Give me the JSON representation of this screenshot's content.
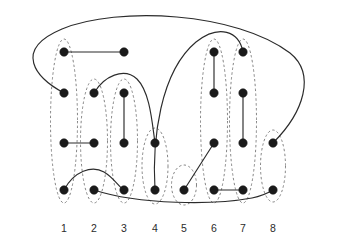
{
  "figure": {
    "canvas": {
      "width": 340,
      "height": 243
    },
    "colors": {
      "vertex": "#1a1a1a",
      "edge": "#2b2b2b",
      "ellipse": "#6f6f6f",
      "label": "#2b2b2b",
      "background": "#ffffff"
    },
    "style": {
      "vertex_radius": 4.2,
      "edge_width": 1.15,
      "ellipse_dash": "2.4 2.4"
    }
  },
  "columns": [
    {
      "label": "1",
      "x": 64,
      "label_x": 64,
      "label_y": 232
    },
    {
      "label": "2",
      "x": 94,
      "label_x": 94,
      "label_y": 232
    },
    {
      "label": "3",
      "x": 124,
      "label_x": 124,
      "label_y": 232
    },
    {
      "label": "4",
      "x": 155,
      "label_x": 155,
      "label_y": 232
    },
    {
      "label": "5",
      "x": 184,
      "label_x": 184,
      "label_y": 232
    },
    {
      "label": "6",
      "x": 214,
      "label_x": 214,
      "label_y": 232
    },
    {
      "label": "7",
      "x": 243,
      "label_x": 243,
      "label_y": 232
    },
    {
      "label": "8",
      "x": 273,
      "label_x": 273,
      "label_y": 232
    }
  ],
  "rows": [
    {
      "index": 1,
      "y": 52
    },
    {
      "index": 2,
      "y": 93
    },
    {
      "index": 3,
      "y": 143
    },
    {
      "index": 4,
      "y": 190
    }
  ],
  "vertices": [
    {
      "id": "c1r1",
      "column": "1",
      "row": 1,
      "cx": 64,
      "cy": 52
    },
    {
      "id": "c1r2",
      "column": "1",
      "row": 2,
      "cx": 64,
      "cy": 93
    },
    {
      "id": "c1r3",
      "column": "1",
      "row": 3,
      "cx": 64,
      "cy": 143
    },
    {
      "id": "c1r4",
      "column": "1",
      "row": 4,
      "cx": 64,
      "cy": 190
    },
    {
      "id": "c2r2",
      "column": "2",
      "row": 2,
      "cx": 94,
      "cy": 93
    },
    {
      "id": "c2r3",
      "column": "2",
      "row": 3,
      "cx": 94,
      "cy": 143
    },
    {
      "id": "c2r4",
      "column": "2",
      "row": 4,
      "cx": 94,
      "cy": 190
    },
    {
      "id": "c3r2",
      "column": "3",
      "row": 2,
      "cx": 124,
      "cy": 93
    },
    {
      "id": "c3r3",
      "column": "3",
      "row": 3,
      "cx": 124,
      "cy": 143
    },
    {
      "id": "c3r4",
      "column": "3",
      "row": 4,
      "cx": 124,
      "cy": 190
    },
    {
      "id": "c3r1",
      "column": "3",
      "row": 1,
      "cx": 124,
      "cy": 52
    },
    {
      "id": "c4r3",
      "column": "4",
      "row": 3,
      "cx": 155,
      "cy": 143
    },
    {
      "id": "c4r4",
      "column": "4",
      "row": 4,
      "cx": 155,
      "cy": 190
    },
    {
      "id": "c5r4",
      "column": "5",
      "row": 4,
      "cx": 184,
      "cy": 190
    },
    {
      "id": "c6r1",
      "column": "6",
      "row": 1,
      "cx": 214,
      "cy": 52
    },
    {
      "id": "c6r2",
      "column": "6",
      "row": 2,
      "cx": 214,
      "cy": 93
    },
    {
      "id": "c6r3",
      "column": "6",
      "row": 3,
      "cx": 214,
      "cy": 143
    },
    {
      "id": "c6r4",
      "column": "6",
      "row": 4,
      "cx": 214,
      "cy": 190
    },
    {
      "id": "c7r1",
      "column": "7",
      "row": 1,
      "cx": 243,
      "cy": 52
    },
    {
      "id": "c7r2",
      "column": "7",
      "row": 2,
      "cx": 243,
      "cy": 93
    },
    {
      "id": "c7r3",
      "column": "7",
      "row": 3,
      "cx": 243,
      "cy": 143
    },
    {
      "id": "c7r4",
      "column": "7",
      "row": 4,
      "cx": 243,
      "cy": 190
    },
    {
      "id": "c8r3",
      "column": "8",
      "row": 3,
      "cx": 273,
      "cy": 143
    },
    {
      "id": "c8r4",
      "column": "8",
      "row": 4,
      "cx": 273,
      "cy": 190
    }
  ],
  "edges": [
    {
      "id": "e1",
      "from": "c1r1",
      "to": "c3r1",
      "shape": "line",
      "path": "M 64 52 L 124 52"
    },
    {
      "id": "e2",
      "from": "c1r3",
      "to": "c2r3",
      "shape": "line",
      "path": "M 64 143 L 94 143"
    },
    {
      "id": "e3",
      "from": "c3r2",
      "to": "c3r3",
      "shape": "line",
      "path": "M 124 93 L 124 143"
    },
    {
      "id": "e4",
      "from": "c6r1",
      "to": "c6r2",
      "shape": "line",
      "path": "M 214 52 L 214 93"
    },
    {
      "id": "e5",
      "from": "c7r2",
      "to": "c7r3",
      "shape": "line",
      "path": "M 243 93 L 243 143"
    },
    {
      "id": "e6",
      "from": "c6r4",
      "to": "c7r4",
      "shape": "line",
      "path": "M 214 190 L 243 190"
    },
    {
      "id": "e7",
      "from": "c5r4",
      "to": "c6r3",
      "shape": "line",
      "path": "M 184 190 L 214 143"
    },
    {
      "id": "e8",
      "from": "c1r2",
      "to": "c8r3",
      "shape": "curve",
      "path": "M 64 93 C 36 78 12 50 62 29 C 118 6 236 12 290 53 C 316 74 304 112 273 143"
    },
    {
      "id": "e9",
      "from": "c4r4",
      "to": "c7r1",
      "shape": "curve",
      "path": "M 155 190 C 152 140 160 72 196 42 C 219 24 239 31 243 52"
    },
    {
      "id": "e10",
      "from": "c2r2",
      "to": "c4r3",
      "shape": "curve",
      "path": "M 94 93 C 104 76 124 67 137 79 C 150 92 152 122 155 143"
    },
    {
      "id": "e11",
      "from": "c1r4",
      "to": "c3r4",
      "shape": "curve",
      "path": "M 64 190 C 74 171 92 165 104 172 C 114 178 118 186 124 190"
    },
    {
      "id": "e12",
      "from": "c2r4",
      "to": "c8r4",
      "shape": "curve",
      "path": "M 94 190 C 140 205 214 205 252 198 C 262 196 268 193 273 190"
    }
  ],
  "blocks": [
    {
      "id": "b1",
      "column": "1",
      "cx": 64,
      "cy": 121,
      "rx": 13.5,
      "ry": 82
    },
    {
      "id": "b2",
      "column": "2",
      "cx": 94,
      "cy": 141,
      "rx": 13.5,
      "ry": 62
    },
    {
      "id": "b3",
      "column": "3",
      "cx": 124,
      "cy": 141,
      "rx": 13.5,
      "ry": 62
    },
    {
      "id": "b4",
      "column": "4",
      "cx": 155,
      "cy": 166,
      "rx": 13.0,
      "ry": 38
    },
    {
      "id": "b5",
      "column": "5",
      "cx": 184,
      "cy": 185,
      "rx": 12.5,
      "ry": 20
    },
    {
      "id": "b6",
      "column": "6",
      "cx": 214,
      "cy": 121,
      "rx": 13.5,
      "ry": 82
    },
    {
      "id": "b7",
      "column": "7",
      "cx": 243,
      "cy": 121,
      "rx": 13.5,
      "ry": 82
    },
    {
      "id": "b8",
      "column": "8",
      "cx": 273,
      "cy": 166,
      "rx": 12.5,
      "ry": 36
    }
  ]
}
